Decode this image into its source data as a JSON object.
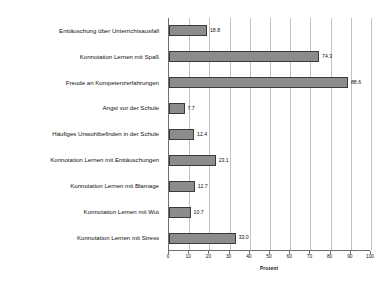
{
  "chart_data": {
    "type": "bar",
    "orientation": "horizontal",
    "title": "",
    "xlabel": "Prozent",
    "ylabel": "",
    "xlim": [
      0,
      100
    ],
    "xticks": [
      0,
      10,
      20,
      30,
      40,
      50,
      60,
      70,
      80,
      90,
      100
    ],
    "grid": "vertical",
    "legend": "none",
    "bar_color": "#8c8c8c",
    "bar_edge_color": "#3a3a3a",
    "categories": [
      "Enttäuschung über Unterrichtsausfall",
      "Konnotation Lernen mit Spaß",
      "Freude an Kompetenzerfahrungen",
      "Angst vor der Schule",
      "Häufiges Unwohlbefinden in der Schule",
      "Konnotation Lernen mit Enttäuschungen",
      "Konnotation Lernen mit Blamage",
      "Konnotation Lernen mit Wut",
      "Konnotation Lernen mit Stress"
    ],
    "values": [
      18.8,
      74.3,
      88.6,
      7.7,
      12.4,
      23.1,
      12.7,
      10.7,
      33.0
    ],
    "value_labels": [
      "18.8",
      "74.3",
      "88.6",
      "7.7",
      "12.4",
      "23.1",
      "12.7",
      "10.7",
      "33.0"
    ]
  }
}
